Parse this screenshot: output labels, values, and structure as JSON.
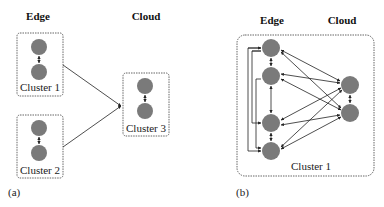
{
  "panel_a": {
    "caption": "(a)",
    "edge_header": "Edge",
    "cloud_header": "Cloud",
    "clusters": [
      {
        "label": "Cluster 1",
        "tier": "Edge",
        "nodes": 2
      },
      {
        "label": "Cluster 2",
        "tier": "Edge",
        "nodes": 2
      },
      {
        "label": "Cluster 3",
        "tier": "Cloud",
        "nodes": 2
      }
    ],
    "connections": [
      {
        "from": "Cluster 1",
        "to": "Cluster 3"
      },
      {
        "from": "Cluster 2",
        "to": "Cluster 3"
      }
    ]
  },
  "panel_b": {
    "caption": "(b)",
    "edge_header": "Edge",
    "cloud_header": "Cloud",
    "cluster_label": "Cluster 1",
    "edge_nodes": 4,
    "cloud_nodes": 2,
    "description": "All edge and cloud nodes fully connected within a single cluster"
  },
  "colors": {
    "node_fill": "#7a7a7a",
    "line": "#222222",
    "box_border": "#555555"
  }
}
